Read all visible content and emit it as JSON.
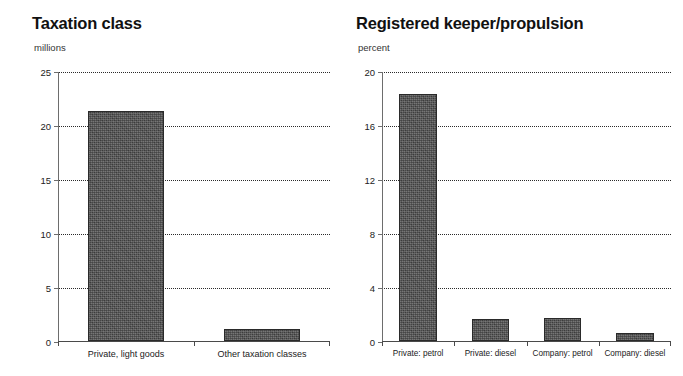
{
  "chart_data": [
    {
      "type": "bar",
      "panel": "left",
      "title": "Taxation class",
      "subtitle": "millions",
      "ylabel": "millions",
      "xlabel": "",
      "categories": [
        "Private, light goods",
        "Other taxation classes"
      ],
      "values": [
        21.3,
        1.1
      ],
      "ylim": [
        0,
        25
      ],
      "yticks": [
        0,
        5,
        10,
        15,
        20,
        25
      ],
      "ytick_labels": [
        "0",
        "5",
        "10",
        "15",
        "20",
        "25"
      ],
      "grid": "horizontal-dotted",
      "legend": "none",
      "bar_color": "#4d4d4d"
    },
    {
      "type": "bar",
      "panel": "right",
      "title": "Registered keeper/propulsion",
      "subtitle": "percent",
      "ylabel": "percent",
      "xlabel": "",
      "categories": [
        "Private: petrol",
        "Private: diesel",
        "Company: petrol",
        "Company: diesel"
      ],
      "values": [
        18.3,
        1.6,
        1.7,
        0.6
      ],
      "ylim": [
        0,
        20
      ],
      "yticks": [
        0,
        4,
        8,
        12,
        16,
        20
      ],
      "ytick_labels": [
        "0",
        "4",
        "8",
        "12",
        "16",
        "20"
      ],
      "grid": "horizontal-dotted",
      "legend": "none",
      "bar_color": "#4d4d4d"
    }
  ],
  "left": {
    "title": "Taxation class",
    "unit": "millions",
    "yticks": [
      {
        "label": "25"
      },
      {
        "label": "20"
      },
      {
        "label": "15"
      },
      {
        "label": "10"
      },
      {
        "label": "5"
      },
      {
        "label": "0"
      }
    ],
    "bars": [
      {
        "label": "Private, light goods",
        "value": "21.3"
      },
      {
        "label": "Other taxation classes",
        "value": "1.1"
      }
    ]
  },
  "right": {
    "title": "Registered keeper/propulsion",
    "unit": "percent",
    "yticks": [
      {
        "label": "20"
      },
      {
        "label": "16"
      },
      {
        "label": "12"
      },
      {
        "label": "8"
      },
      {
        "label": "4"
      },
      {
        "label": "0"
      }
    ],
    "bars": [
      {
        "label": "Private: petrol",
        "value": "18.3"
      },
      {
        "label": "Private: diesel",
        "value": "1.6"
      },
      {
        "label": "Company: petrol",
        "value": "1.7"
      },
      {
        "label": "Company: diesel",
        "value": "0.6"
      }
    ]
  }
}
